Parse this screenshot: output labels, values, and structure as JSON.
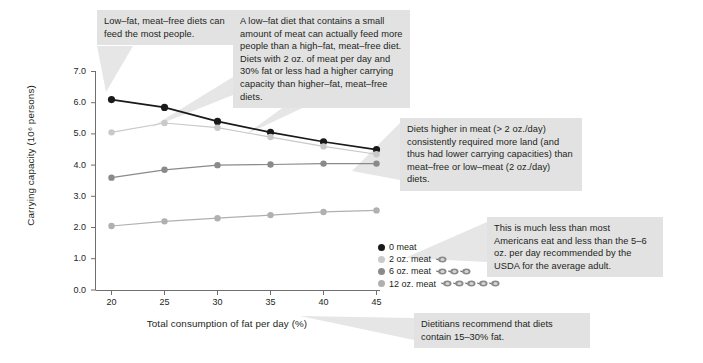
{
  "chart_data": {
    "type": "line",
    "title": "",
    "xlabel": "Total consumption of fat per day (%)",
    "ylabel": "Carrying capacity (10⁶ persons)",
    "x": [
      20,
      25,
      30,
      35,
      40,
      45
    ],
    "xlim": [
      18.5,
      46.5
    ],
    "ylim": [
      0.0,
      7.0
    ],
    "xticks": [
      "20",
      "25",
      "30",
      "35",
      "40",
      "45"
    ],
    "yticks": [
      "0.0",
      "1.0",
      "2.0",
      "3.0",
      "4.0",
      "5.0",
      "6.0",
      "7.0"
    ],
    "grid": false,
    "legend_position": "inside-lower-right",
    "series": [
      {
        "name": "0 meat",
        "color": "#1a1a1a",
        "meat_icons": 0,
        "values": [
          6.1,
          5.85,
          5.4,
          5.05,
          4.75,
          4.5
        ]
      },
      {
        "name": "2 oz. meat",
        "color": "#c9c9c9",
        "meat_icons": 1,
        "values": [
          5.05,
          5.35,
          5.2,
          4.9,
          4.6,
          4.35
        ]
      },
      {
        "name": "6 oz. meat",
        "color": "#8a8a8a",
        "meat_icons": 3,
        "values": [
          3.6,
          3.85,
          4.0,
          4.02,
          4.05,
          4.05
        ]
      },
      {
        "name": "12 oz. meat",
        "color": "#b0b0b0",
        "meat_icons": 5,
        "values": [
          2.05,
          2.2,
          2.3,
          2.4,
          2.5,
          2.55
        ]
      }
    ]
  },
  "annotations": [
    {
      "id": "callout-low-fat-meat-free",
      "text": "Low–fat, meat–free diets can feed the most people."
    },
    {
      "id": "callout-small-amount-meat",
      "text": "A low–fat diet that contains a small amount of meat can actually feed more people than a high–fat, meat–free diet. Diets with 2 oz. of meat per day and 30% fat or less had a higher carrying capacity than higher–fat, meat–free diets."
    },
    {
      "id": "callout-higher-meat-more-land",
      "text": "Diets higher in meat (> 2 oz./day) consistently required more land (and thus had lower carrying capacities) than meat–free or low–meat (2 oz./day) diets."
    },
    {
      "id": "callout-usda-recommendation",
      "text": "This is much less than most Americans eat and less than the 5–6 oz. per day recommended by the USDA for the average adult."
    },
    {
      "id": "callout-dietitians-fat",
      "text": "Dietitians recommend that diets contain 15–30% fat."
    }
  ],
  "colors": {
    "callout_background": "#e2e2e2",
    "pointer_fill": "#e6e6e6",
    "axis": "#6f6f6f",
    "text": "#231f20"
  }
}
